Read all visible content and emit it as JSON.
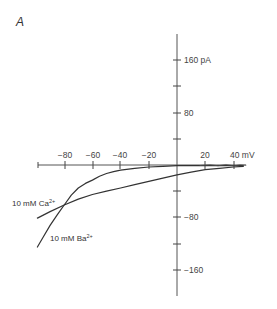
{
  "panel_label": "A",
  "chart_data": {
    "type": "line",
    "title": "",
    "panel": "A",
    "xlabel": "mV",
    "ylabel": "pA",
    "x_unit": "mV",
    "y_unit": "pA",
    "xlim": [
      -100,
      48
    ],
    "ylim": [
      -195,
      195
    ],
    "x_ticks": [
      -80,
      -60,
      -40,
      -20,
      0,
      20,
      40
    ],
    "x_tick_labels": [
      "-80",
      "-60",
      "-40",
      "-20",
      "",
      "20",
      "40 mV"
    ],
    "y_ticks": [
      160,
      120,
      80,
      40,
      -40,
      -80,
      -120,
      -160
    ],
    "y_tick_labels": [
      "160 pA",
      "",
      "80",
      "",
      "",
      "-80",
      "",
      "-160"
    ],
    "grid": false,
    "legend": "inline labels",
    "series": [
      {
        "name": "10 mM Ca2+",
        "label": "10 mM Ca²⁺",
        "x": [
          -99,
          -90,
          -80,
          -70,
          -60,
          -50,
          -40,
          -30,
          -20,
          -10,
          0,
          10,
          20,
          30,
          40,
          47
        ],
        "y": [
          -81,
          -71,
          -61,
          -52,
          -45,
          -40,
          -35,
          -30,
          -25,
          -20,
          -15,
          -11,
          -7,
          -5,
          -3,
          -2
        ]
      },
      {
        "name": "10 mM Ba2+",
        "label": "10 mM Ba²⁺",
        "x": [
          -99,
          -95,
          -90,
          -85,
          -80,
          -75,
          -70,
          -65,
          -60,
          -55,
          -50,
          -45,
          -40,
          -30,
          -20,
          -10,
          0,
          20,
          40,
          47
        ],
        "y": [
          -125,
          -110,
          -92,
          -76,
          -61,
          -46,
          -35,
          -28,
          -23,
          -17,
          -13,
          -10,
          -8,
          -5,
          -3,
          -2,
          -1,
          -1,
          -1,
          -1
        ]
      }
    ]
  },
  "labels": {
    "x_ticks": {
      "m80": "−80",
      "m60": "−60",
      "m40": "−40",
      "m20": "−20",
      "p20": "20",
      "p40": "40 mV"
    },
    "y_ticks": {
      "p160": "160 pA",
      "p80": "80",
      "m80": "−80",
      "m160": "−160"
    },
    "ca_label": "10 mM Ca",
    "ca_sup": "2+",
    "ba_label": "10 mM Ba",
    "ba_sup": "2+"
  }
}
